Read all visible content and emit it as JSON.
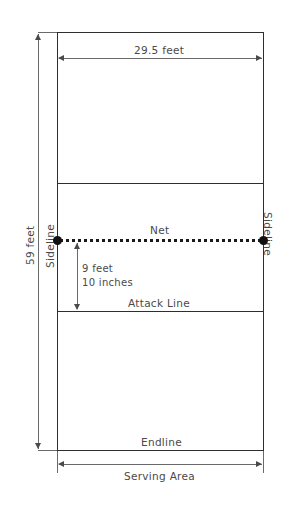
{
  "diagram": {
    "labels": {
      "court_width": "29.5 feet",
      "court_length": "59 feet",
      "sideline_left": "Sideline",
      "sideline_right": "Sideline",
      "net": "Net",
      "attack_distance_line1": "9 feet",
      "attack_distance_line2": "10 inches",
      "attack_line": "Attack Line",
      "endline": "Endline",
      "serving_area": "Serving Area"
    },
    "colors": {
      "court_line": "#2e2e2e",
      "dimension_line": "#6a6a6a",
      "net_dash": "#1a1a1a",
      "net_post": "#111111",
      "text": "#4a4a4a",
      "background": "#ffffff"
    },
    "measurements": {
      "width_feet": 29.5,
      "length_feet": 59,
      "attack_line_distance": "9 feet 10 inches"
    }
  }
}
